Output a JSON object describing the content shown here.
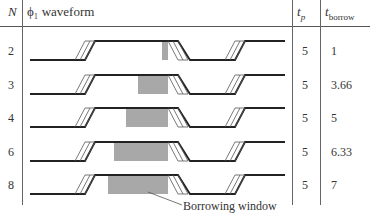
{
  "table": {
    "headers": {
      "n": "N",
      "waveform": "ϕ₁ waveform",
      "tp": "t",
      "tp_sub": "p",
      "tborrow": "t",
      "tborrow_sub": "borrow"
    },
    "rows": [
      {
        "n": "2",
        "tp": "5",
        "tborrow": "1",
        "shade_start": 162
      },
      {
        "n": "3",
        "tp": "5",
        "tborrow": "3.66",
        "shade_start": 138
      },
      {
        "n": "4",
        "tp": "5",
        "tborrow": "5",
        "shade_start": 126
      },
      {
        "n": "6",
        "tp": "5",
        "tborrow": "6.33",
        "shade_start": 114
      },
      {
        "n": "8",
        "tp": "5",
        "tborrow": "7",
        "shade_start": 108
      }
    ]
  },
  "annotation": {
    "label": "Borrowing window"
  },
  "colors": {
    "line": "#222222",
    "shade": "#a8a8a8",
    "rule": "#666666"
  }
}
